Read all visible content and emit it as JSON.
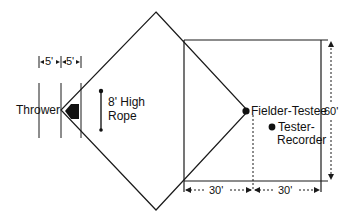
{
  "diagram": {
    "labels": {
      "thrower": "Thrower",
      "rope_line1": "8' High",
      "rope_line2": "Rope",
      "fielder": "Fielder-Testee",
      "tester_line1": "Tester-",
      "tester_line2": "Recorder"
    },
    "dimensions": {
      "left_spacing_1": "5'",
      "left_spacing_2": "5'",
      "height": "60'",
      "bottom_left": "30'",
      "bottom_right": "30'"
    },
    "colors": {
      "stroke": "#1a1a1a",
      "background": "#ffffff"
    }
  }
}
